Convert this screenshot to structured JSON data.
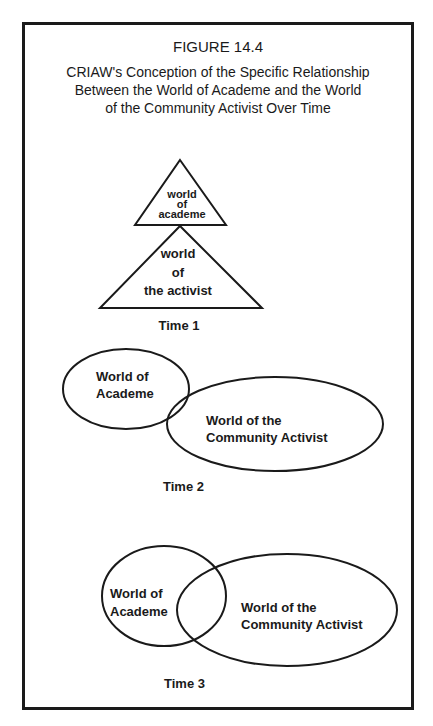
{
  "figure": {
    "number": "FIGURE 14.4",
    "caption_lines": [
      "CRIAW's Conception of the Specific Relationship",
      "Between the World of Academe and the World",
      "of the Community Activist Over Time"
    ]
  },
  "time1": {
    "label": "Time 1",
    "small_triangle": [
      "world",
      "of",
      "academe"
    ],
    "large_triangle": [
      "world",
      "of",
      "the activist"
    ]
  },
  "time2": {
    "label": "Time 2",
    "academe": [
      "World of",
      "Academe"
    ],
    "activist": [
      "World of the",
      "Community Activist"
    ]
  },
  "time3": {
    "label": "Time 3",
    "academe": [
      "World of",
      "Academe"
    ],
    "activist": [
      "World of the",
      "Community Activist"
    ]
  }
}
